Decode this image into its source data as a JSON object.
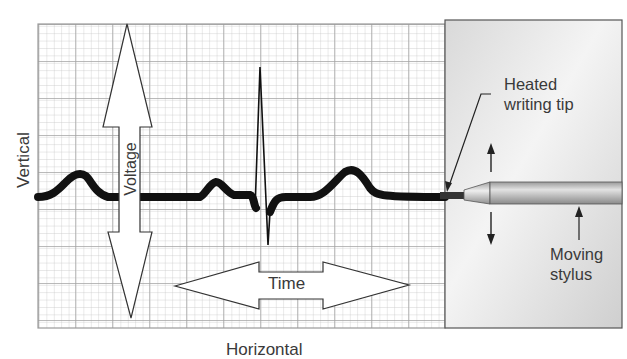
{
  "figure": {
    "labels": {
      "vertical": "Vertical",
      "horizontal": "Horizontal",
      "voltage": "Voltage",
      "time": "Time",
      "heated_tip_line1": "Heated",
      "heated_tip_line2": "writing tip",
      "moving_stylus_line1": "Moving",
      "moving_stylus_line2": "stylus"
    },
    "colors": {
      "paper": "#ffffff",
      "grid_minor": "#c8c8c8",
      "grid_major": "#a8a8a8",
      "trace": "#111111",
      "panel": "#e6e6e6",
      "stylus": "#b9b9b9",
      "text": "#3a3a3a"
    }
  }
}
